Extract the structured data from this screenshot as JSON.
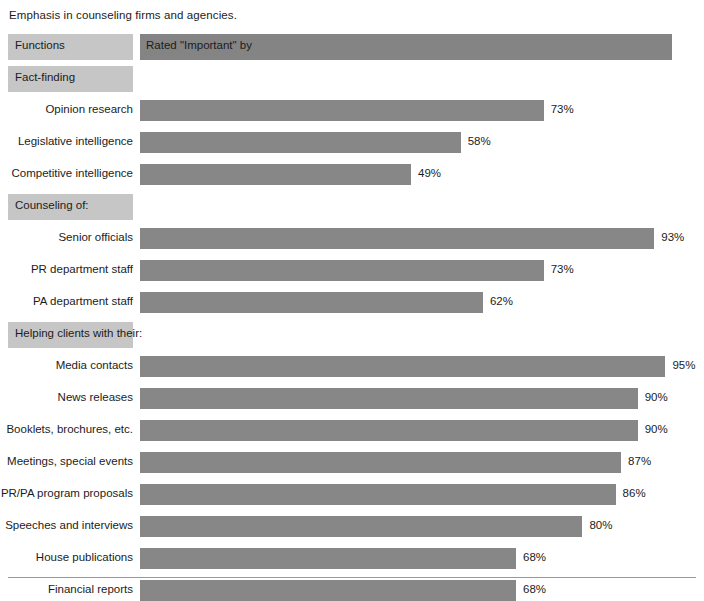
{
  "caption": "Emphasis in counseling firms and agencies.",
  "colors": {
    "bar": "#878787",
    "header_bar": "#848484",
    "label_box": "#c6c6c6",
    "text": "#1c1c1c",
    "rule": "#9a9a9a",
    "background": "#ffffff"
  },
  "header": {
    "functions_label": "Functions",
    "rated_label": "Rated \"Important\" by"
  },
  "chart_data": {
    "type": "bar",
    "orientation": "horizontal",
    "title": "Emphasis in counseling firms and agencies.",
    "xlabel": "",
    "ylabel": "",
    "xlim": [
      0,
      100
    ],
    "grid": false,
    "legend": false,
    "value_suffix": "%",
    "column_headers": [
      "Functions",
      "Rated \"Important\" by"
    ],
    "sections": [
      {
        "name": "Fact-finding",
        "items": [
          {
            "label": "Opinion research",
            "value": 73,
            "value_text": "73%"
          },
          {
            "label": "Legislative intelligence",
            "value": 58,
            "value_text": "58%"
          },
          {
            "label": "Competitive intelligence",
            "value": 49,
            "value_text": "49%"
          }
        ]
      },
      {
        "name": "Counseling of:",
        "items": [
          {
            "label": "Senior officials",
            "value": 93,
            "value_text": "93%"
          },
          {
            "label": "PR department staff",
            "value": 73,
            "value_text": "73%"
          },
          {
            "label": "PA department staff",
            "value": 62,
            "value_text": "62%"
          }
        ]
      },
      {
        "name": "Helping clients with their:",
        "items": [
          {
            "label": "Media contacts",
            "value": 95,
            "value_text": "95%"
          },
          {
            "label": "News releases",
            "value": 90,
            "value_text": "90%"
          },
          {
            "label": "Booklets, brochures, etc.",
            "value": 90,
            "value_text": "90%"
          },
          {
            "label": "Meetings, special events",
            "value": 87,
            "value_text": "87%"
          },
          {
            "label": "PR/PA program proposals",
            "value": 86,
            "value_text": "86%"
          },
          {
            "label": "Speeches and interviews",
            "value": 80,
            "value_text": "80%"
          },
          {
            "label": "House publications",
            "value": 68,
            "value_text": "68%"
          },
          {
            "label": "Financial reports",
            "value": 68,
            "value_text": "68%"
          }
        ]
      }
    ],
    "categories": [
      "Opinion research",
      "Legislative intelligence",
      "Competitive intelligence",
      "Senior officials",
      "PR department staff",
      "PA department staff",
      "Media contacts",
      "News releases",
      "Booklets, brochures, etc.",
      "Meetings, special events",
      "PR/PA program proposals",
      "Speeches and interviews",
      "House publications",
      "Financial reports"
    ],
    "values": [
      73,
      58,
      49,
      93,
      73,
      62,
      95,
      90,
      90,
      87,
      86,
      80,
      68,
      68
    ]
  }
}
